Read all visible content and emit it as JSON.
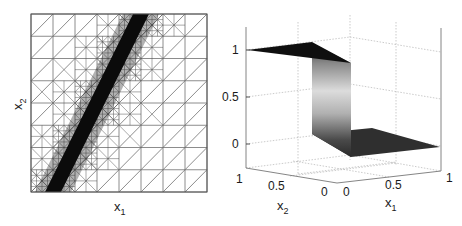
{
  "chart_data": [
    {
      "type": "mesh",
      "panel": "left",
      "title": "",
      "xlabel": "x1",
      "ylabel": "x2",
      "xlim": [
        0,
        1
      ],
      "ylim": [
        0,
        1
      ],
      "grid_cells": 8,
      "refinement_band": {
        "from": [
          0.125,
          0.0
        ],
        "to": [
          0.625,
          1.0
        ],
        "description": "adaptively refined triangles concentrated along diagonal discontinuity"
      },
      "colors": {
        "mesh": "#707070",
        "band": "#111111"
      }
    },
    {
      "type": "surface3d",
      "panel": "right",
      "title": "",
      "xlabel": "x1",
      "ylabel": "x2",
      "zlabel": "",
      "xlim": [
        0,
        1
      ],
      "ylim": [
        0,
        1
      ],
      "zlim": [
        -0.2,
        1.2
      ],
      "xticks": [
        "0",
        "0.5",
        "1"
      ],
      "yticks": [
        "0",
        "0.5",
        "1"
      ],
      "zticks": [
        "0",
        "0.5",
        "1"
      ],
      "surface": {
        "upper_value": 1,
        "lower_value": 0,
        "description": "step function: u=1 on one side of the diagonal, u=0 on the other, with steep vertical transition"
      },
      "grid": true
    }
  ],
  "left": {
    "xlabel": "x",
    "xlabel_sub": "1",
    "ylabel": "x",
    "ylabel_sub": "2"
  },
  "right": {
    "zticks": [
      "1",
      "0.5",
      "0"
    ],
    "x1ticks": [
      "0",
      "0.5",
      "1"
    ],
    "x2ticks": [
      "1",
      "0.5",
      "0"
    ],
    "x1label": "x",
    "x1label_sub": "1",
    "x2label": "x",
    "x2label_sub": "2"
  }
}
